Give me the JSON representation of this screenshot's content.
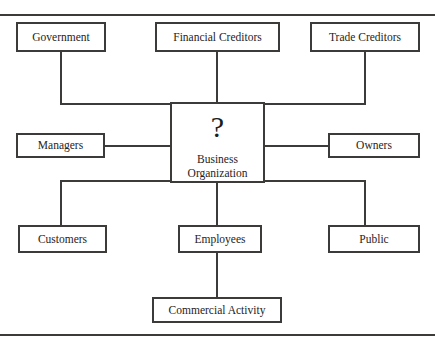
{
  "figure": {
    "title_partial": "",
    "rules": {
      "top": "horizontal-rule",
      "bottom": "horizontal-rule"
    }
  },
  "diagram": {
    "type": "stakeholder-map",
    "center": {
      "symbol": "?",
      "line1": "Business",
      "line2": "Organization"
    },
    "nodes": [
      {
        "id": "government",
        "label": "Government",
        "row": "top",
        "col": "left"
      },
      {
        "id": "financial-creditors",
        "label": "Financial Creditors",
        "row": "top",
        "col": "center"
      },
      {
        "id": "trade-creditors",
        "label": "Trade Creditors",
        "row": "top",
        "col": "right"
      },
      {
        "id": "managers",
        "label": "Managers",
        "row": "middle",
        "col": "left"
      },
      {
        "id": "owners",
        "label": "Owners",
        "row": "middle",
        "col": "right"
      },
      {
        "id": "customers",
        "label": "Customers",
        "row": "bottom",
        "col": "left"
      },
      {
        "id": "employees",
        "label": "Employees",
        "row": "bottom",
        "col": "center"
      },
      {
        "id": "public",
        "label": "Public",
        "row": "bottom",
        "col": "right"
      },
      {
        "id": "commercial-activity",
        "label": "Commercial Activity",
        "row": "footer",
        "col": "center"
      }
    ],
    "connections": [
      {
        "from": "government",
        "to": "business-organization"
      },
      {
        "from": "financial-creditors",
        "to": "business-organization"
      },
      {
        "from": "trade-creditors",
        "to": "business-organization"
      },
      {
        "from": "managers",
        "to": "business-organization"
      },
      {
        "from": "owners",
        "to": "business-organization"
      },
      {
        "from": "business-organization",
        "to": "customers"
      },
      {
        "from": "business-organization",
        "to": "employees"
      },
      {
        "from": "business-organization",
        "to": "public"
      },
      {
        "from": "employees",
        "to": "commercial-activity"
      }
    ],
    "colors": {
      "stroke": "#3d3a3a",
      "text": "#272323",
      "background": "#ffffff"
    }
  }
}
